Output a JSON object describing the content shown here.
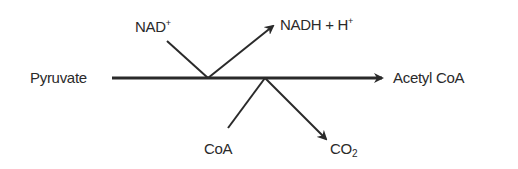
{
  "diagram": {
    "title": "",
    "reactant": "Pyruvate",
    "product": "Acetyl CoA",
    "inputs": [
      {
        "base": "NAD",
        "sup": "+"
      },
      {
        "base": "CoA"
      }
    ],
    "outputs": [
      {
        "base": "NADH + H",
        "sup": "+"
      },
      {
        "base": "CO",
        "sub": "2"
      }
    ],
    "colors": {
      "ink": "#2a2a2a",
      "background": "#ffffff"
    }
  }
}
